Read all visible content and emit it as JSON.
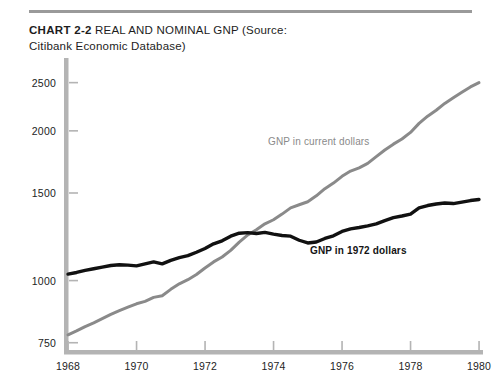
{
  "caption": {
    "chart_number": "CHART 2-2",
    "title": "REAL AND NOMINAL GNP (Source:",
    "title_line2": "Citibank Economic Database)"
  },
  "colors": {
    "nominal": "#8a8a8a",
    "real": "#111111",
    "axis": "#b4b4b4",
    "rule": "#9a9a9a",
    "background": "#ffffff"
  },
  "chart_data": {
    "type": "line",
    "title": "REAL AND NOMINAL GNP",
    "xlabel": "",
    "ylabel": "Billions of dollars",
    "yscale": "log",
    "ylim": [
      725,
      2750
    ],
    "xlim": [
      1968,
      1980
    ],
    "grid": false,
    "legend": "inline-annotations",
    "yticks": [
      750,
      1000,
      1500,
      2000,
      2500
    ],
    "ytick_labels": [
      "750",
      "1000",
      "1500",
      "2000",
      "2500"
    ],
    "xticks": [
      1968,
      1970,
      1972,
      1974,
      1976,
      1978,
      1980
    ],
    "xtick_labels": [
      "1968",
      "1970",
      "1972",
      "1974",
      "1976",
      "1978",
      "1980"
    ],
    "x": [
      1968,
      1968.25,
      1968.5,
      1968.75,
      1969,
      1969.25,
      1969.5,
      1969.75,
      1970,
      1970.25,
      1970.5,
      1970.75,
      1971,
      1971.25,
      1971.5,
      1971.75,
      1972,
      1972.25,
      1972.5,
      1972.75,
      1973,
      1973.25,
      1973.5,
      1973.75,
      1974,
      1974.25,
      1974.5,
      1974.75,
      1975,
      1975.25,
      1975.5,
      1975.75,
      1976,
      1976.25,
      1976.5,
      1976.75,
      1977,
      1977.25,
      1977.5,
      1977.75,
      1978,
      1978.25,
      1978.5,
      1978.75,
      1979,
      1979.25,
      1979.5,
      1979.75,
      1980
    ],
    "series": [
      {
        "name": "GNP in current dollars",
        "color": "#8a8a8a",
        "label_annotation": "GNP in current dollars",
        "values": [
          778,
          792,
          808,
          822,
          838,
          855,
          870,
          884,
          898,
          908,
          925,
          932,
          960,
          985,
          1004,
          1028,
          1060,
          1090,
          1115,
          1150,
          1195,
          1235,
          1265,
          1300,
          1325,
          1360,
          1400,
          1420,
          1440,
          1480,
          1530,
          1570,
          1620,
          1660,
          1685,
          1720,
          1775,
          1830,
          1880,
          1925,
          1985,
          2070,
          2140,
          2200,
          2270,
          2330,
          2390,
          2450,
          2500
        ]
      },
      {
        "name": "GNP in 1972 dollars",
        "color": "#111111",
        "label_annotation": "GNP in 1972 dollars",
        "values": [
          1030,
          1038,
          1048,
          1056,
          1064,
          1072,
          1076,
          1074,
          1070,
          1080,
          1090,
          1080,
          1098,
          1112,
          1122,
          1140,
          1160,
          1185,
          1202,
          1228,
          1245,
          1248,
          1243,
          1250,
          1240,
          1232,
          1228,
          1205,
          1190,
          1195,
          1215,
          1230,
          1255,
          1270,
          1278,
          1288,
          1300,
          1320,
          1338,
          1348,
          1360,
          1400,
          1415,
          1425,
          1432,
          1428,
          1438,
          1448,
          1455
        ]
      }
    ]
  }
}
